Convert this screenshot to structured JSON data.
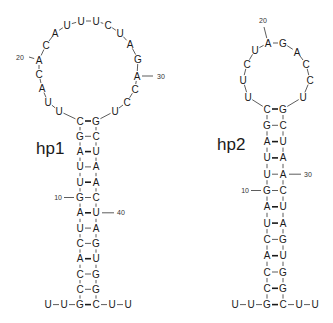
{
  "figure": {
    "hairpins": [
      {
        "id": "hp1",
        "label": "hp1",
        "label_pos": [
          36,
          154
        ],
        "stem_x": [
          80,
          96
        ],
        "stem_top_y": 121,
        "stem_step": 15.3,
        "stem_pairs": [
          [
            "C",
            "G",
            "wc"
          ],
          [
            "G",
            "C",
            "gu"
          ],
          [
            "A",
            "U",
            "wc"
          ],
          [
            "U",
            "A",
            "gu"
          ],
          [
            "U",
            "A",
            "wc"
          ],
          [
            "G",
            "C",
            "gu"
          ],
          [
            "A",
            "U",
            "wc"
          ],
          [
            "U",
            "A",
            "gu"
          ],
          [
            "C",
            "G",
            "gu"
          ],
          [
            "A",
            "U",
            "wc"
          ],
          [
            "C",
            "G",
            "gu"
          ],
          [
            "C",
            "G",
            "gu"
          ],
          [
            "G",
            "C",
            "wc"
          ]
        ],
        "tail_left": [
          "U",
          "U"
        ],
        "tail_right": [
          "U",
          "U"
        ],
        "loop": [
          {
            "nt": "U",
            "x": 59,
            "y": 111
          },
          {
            "nt": "U",
            "x": 48,
            "y": 102
          },
          {
            "nt": "A",
            "x": 42,
            "y": 88
          },
          {
            "nt": "C",
            "x": 39,
            "y": 74
          },
          {
            "nt": "A",
            "x": 39,
            "y": 60
          },
          {
            "nt": "C",
            "x": 46,
            "y": 45
          },
          {
            "nt": "A",
            "x": 55,
            "y": 33
          },
          {
            "nt": "U",
            "x": 67,
            "y": 25
          },
          {
            "nt": "U",
            "x": 81,
            "y": 21
          },
          {
            "nt": "U",
            "x": 96,
            "y": 21
          },
          {
            "nt": "C",
            "x": 108,
            "y": 25
          },
          {
            "nt": "U",
            "x": 120,
            "y": 33
          },
          {
            "nt": "A",
            "x": 130,
            "y": 44
          },
          {
            "nt": "G",
            "x": 138,
            "y": 59
          },
          {
            "nt": "A",
            "x": 137,
            "y": 76
          },
          {
            "nt": "C",
            "x": 135,
            "y": 89
          },
          {
            "nt": "C",
            "x": 127,
            "y": 102
          },
          {
            "nt": "U",
            "x": 115,
            "y": 111
          }
        ],
        "index_marks": [
          {
            "text": "20",
            "at": [
              39,
              60
            ],
            "label": [
              16,
              57
            ],
            "from": [
              29,
              57
            ]
          },
          {
            "text": "30",
            "at": [
              137,
              76
            ],
            "label": [
              157,
              76
            ],
            "from": [
              153,
              76
            ]
          },
          {
            "text": "10",
            "stem_row": 5,
            "side": "left"
          },
          {
            "text": "40",
            "stem_row": 6,
            "side": "right"
          }
        ]
      },
      {
        "id": "hp2",
        "label": "hp2",
        "label_pos": [
          217,
          150
        ],
        "stem_x": [
          267,
          283
        ],
        "stem_top_y": 109,
        "stem_step": 16.3,
        "stem_pairs": [
          [
            "C",
            "G",
            "wc"
          ],
          [
            "G",
            "C",
            "gu"
          ],
          [
            "A",
            "U",
            "wc"
          ],
          [
            "U",
            "A",
            "wc"
          ],
          [
            "U",
            "A",
            "gu"
          ],
          [
            "G",
            "C",
            "gu"
          ],
          [
            "A",
            "U",
            "wc"
          ],
          [
            "U",
            "A",
            "wc"
          ],
          [
            "C",
            "G",
            "gu"
          ],
          [
            "A",
            "U",
            "wc"
          ],
          [
            "C",
            "G",
            "gu"
          ],
          [
            "C",
            "G",
            "wc"
          ],
          [
            "G",
            "C",
            "wc"
          ]
        ],
        "tail_left": [
          "U",
          "U"
        ],
        "tail_right": [
          "U",
          "U"
        ],
        "loop": [
          {
            "nt": "U",
            "x": 248,
            "y": 97
          },
          {
            "nt": "U",
            "x": 243,
            "y": 80
          },
          {
            "nt": "C",
            "x": 247,
            "y": 64
          },
          {
            "nt": "U",
            "x": 255,
            "y": 50
          },
          {
            "nt": "A",
            "x": 268,
            "y": 43
          },
          {
            "nt": "G",
            "x": 283,
            "y": 43
          },
          {
            "nt": "A",
            "x": 297,
            "y": 52
          },
          {
            "nt": "C",
            "x": 306,
            "y": 64
          },
          {
            "nt": "C",
            "x": 310,
            "y": 80
          },
          {
            "nt": "U",
            "x": 303,
            "y": 97
          }
        ],
        "index_marks": [
          {
            "text": "20",
            "at": [
              268,
              43
            ],
            "label": [
              263,
              20
            ],
            "from": [
              264,
              27
            ]
          },
          {
            "text": "30",
            "stem_row": 4,
            "side": "right"
          },
          {
            "text": "10",
            "stem_row": 5,
            "side": "left"
          }
        ]
      }
    ],
    "colors": {
      "ink": "#1a1a1a",
      "background": "#ffffff"
    }
  }
}
